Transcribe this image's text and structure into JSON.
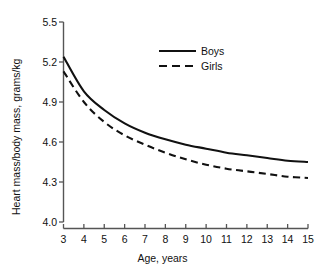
{
  "chart_data": {
    "type": "line",
    "title": "",
    "xlabel": "Age, years",
    "ylabel": "Heart mass/body mass, grams/kg",
    "xlim": [
      3,
      15
    ],
    "ylim": [
      4.0,
      5.5
    ],
    "xticks": [
      3,
      4,
      5,
      6,
      7,
      8,
      9,
      10,
      11,
      12,
      13,
      14,
      15
    ],
    "yticks": [
      4.0,
      4.3,
      4.6,
      4.9,
      5.2,
      5.5
    ],
    "ytick_labels": [
      "4.0",
      "4.3",
      "4.6",
      "4.9",
      "5.2",
      "5.5"
    ],
    "xtick_labels": [
      "3",
      "4",
      "5",
      "6",
      "7",
      "8",
      "9",
      "10",
      "11",
      "12",
      "13",
      "14",
      "15"
    ],
    "grid": false,
    "legend_position": "upper-right",
    "x": [
      3,
      4,
      5,
      6,
      7,
      8,
      9,
      10,
      11,
      12,
      13,
      14,
      15
    ],
    "series": [
      {
        "name": "Boys",
        "style": "solid",
        "color": "#111111",
        "values": [
          5.24,
          4.98,
          4.84,
          4.74,
          4.67,
          4.62,
          4.58,
          4.55,
          4.52,
          4.5,
          4.48,
          4.46,
          4.45
        ]
      },
      {
        "name": "Girls",
        "style": "dashed",
        "color": "#111111",
        "values": [
          5.13,
          4.9,
          4.75,
          4.65,
          4.58,
          4.52,
          4.47,
          4.43,
          4.4,
          4.38,
          4.36,
          4.34,
          4.33
        ]
      }
    ]
  },
  "axes": {
    "xlabel": "Age, years",
    "ylabel": "Heart mass/body mass, grams/kg"
  },
  "legend": {
    "items": [
      {
        "label": "Boys",
        "style": "solid"
      },
      {
        "label": "Girls",
        "style": "dashed"
      }
    ]
  },
  "colors": {
    "line": "#111111",
    "axis": "#5a5a5a",
    "background": "#ffffff"
  }
}
